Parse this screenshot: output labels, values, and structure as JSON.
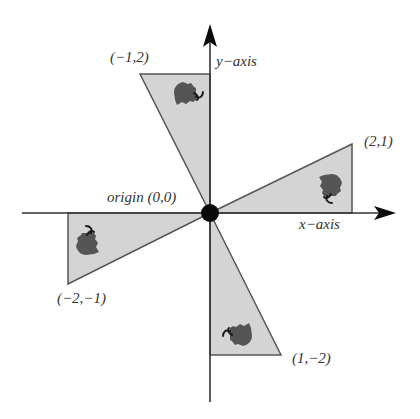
{
  "diagram": {
    "colors": {
      "axis": "#333333",
      "triangle_fill": "#d4d4d4",
      "triangle_stroke": "#555555",
      "flower": "#555555",
      "flower_stem": "#1a1a1a",
      "origin_dot": "#0a0a0a",
      "label": "#333333"
    },
    "axes": {
      "x_label": "x−axis",
      "y_label": "y−axis"
    },
    "origin": {
      "label": "origin (0,0)",
      "px": [
        210,
        213
      ]
    },
    "vertices": [
      {
        "label": "(−1,2)",
        "coord": [
          -1,
          2
        ]
      },
      {
        "label": "(2,1)",
        "coord": [
          2,
          1
        ]
      },
      {
        "label": "(−2,−1)",
        "coord": [
          -2,
          -1
        ]
      },
      {
        "label": "(1,−2)",
        "coord": [
          1,
          -2
        ]
      }
    ],
    "triangles": [
      {
        "name": "top",
        "points": "210,213 140,74 210,74",
        "rotation_deg": 0
      },
      {
        "name": "right",
        "points": "210,213 352,144 352,213",
        "rotation_deg": 90
      },
      {
        "name": "left",
        "points": "210,213 68,213 68,284",
        "rotation_deg": 270
      },
      {
        "name": "bottom",
        "points": "210,213 210,355 281,355",
        "rotation_deg": 180
      }
    ]
  }
}
